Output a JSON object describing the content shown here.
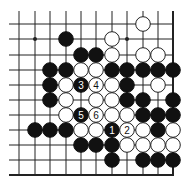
{
  "diagram": {
    "colors": {
      "background": "#ffffff",
      "line": "#222222",
      "black_stone": "#111111",
      "white_stone": "#ffffff",
      "white_stroke": "#222222"
    },
    "grid": {
      "columns_x": [
        19,
        35,
        50,
        66,
        81,
        96,
        112,
        127,
        143,
        158,
        173
      ],
      "rows_y": [
        24,
        39,
        55,
        70,
        85,
        100,
        115,
        130,
        145,
        160,
        175
      ],
      "line_left_x": 9,
      "line_top_y": 11,
      "right_edge_col": 10,
      "bottom_edge_row": 10,
      "stone_radius": 7.3
    },
    "star_points": [
      {
        "col": 1,
        "row": 1
      },
      {
        "col": 7,
        "row": 1
      }
    ],
    "stones": [
      {
        "col": 8,
        "row": 0,
        "color": "white"
      },
      {
        "col": 3,
        "row": 1,
        "color": "black"
      },
      {
        "col": 6,
        "row": 1,
        "color": "white"
      },
      {
        "col": 4,
        "row": 2,
        "color": "black"
      },
      {
        "col": 5,
        "row": 2,
        "color": "black"
      },
      {
        "col": 6,
        "row": 2,
        "color": "white"
      },
      {
        "col": 8,
        "row": 2,
        "color": "white"
      },
      {
        "col": 9,
        "row": 2,
        "color": "white"
      },
      {
        "col": 2,
        "row": 3,
        "color": "black"
      },
      {
        "col": 3,
        "row": 3,
        "color": "black"
      },
      {
        "col": 4,
        "row": 3,
        "color": "white"
      },
      {
        "col": 5,
        "row": 3,
        "color": "white"
      },
      {
        "col": 6,
        "row": 3,
        "color": "black"
      },
      {
        "col": 7,
        "row": 3,
        "color": "black"
      },
      {
        "col": 8,
        "row": 3,
        "color": "black"
      },
      {
        "col": 9,
        "row": 3,
        "color": "black"
      },
      {
        "col": 10,
        "row": 3,
        "color": "black"
      },
      {
        "col": 2,
        "row": 4,
        "color": "black"
      },
      {
        "col": 3,
        "row": 4,
        "color": "white"
      },
      {
        "col": 4,
        "row": 4,
        "color": "black",
        "label": "3"
      },
      {
        "col": 5,
        "row": 4,
        "color": "white",
        "label": "4"
      },
      {
        "col": 6,
        "row": 4,
        "color": "white"
      },
      {
        "col": 7,
        "row": 4,
        "color": "black"
      },
      {
        "col": 9,
        "row": 4,
        "color": "white"
      },
      {
        "col": 2,
        "row": 5,
        "color": "black"
      },
      {
        "col": 3,
        "row": 5,
        "color": "white"
      },
      {
        "col": 5,
        "row": 5,
        "color": "white"
      },
      {
        "col": 6,
        "row": 5,
        "color": "white"
      },
      {
        "col": 7,
        "row": 5,
        "color": "black"
      },
      {
        "col": 8,
        "row": 5,
        "color": "black"
      },
      {
        "col": 10,
        "row": 5,
        "color": "black"
      },
      {
        "col": 3,
        "row": 6,
        "color": "white"
      },
      {
        "col": 4,
        "row": 6,
        "color": "black",
        "label": "5"
      },
      {
        "col": 5,
        "row": 6,
        "color": "white",
        "label": "6"
      },
      {
        "col": 6,
        "row": 6,
        "color": "white"
      },
      {
        "col": 7,
        "row": 6,
        "color": "white"
      },
      {
        "col": 8,
        "row": 6,
        "color": "black"
      },
      {
        "col": 9,
        "row": 6,
        "color": "black"
      },
      {
        "col": 10,
        "row": 6,
        "color": "black"
      },
      {
        "col": 1,
        "row": 7,
        "color": "black"
      },
      {
        "col": 2,
        "row": 7,
        "color": "black"
      },
      {
        "col": 3,
        "row": 7,
        "color": "black"
      },
      {
        "col": 4,
        "row": 7,
        "color": "white"
      },
      {
        "col": 5,
        "row": 7,
        "color": "white"
      },
      {
        "col": 6,
        "row": 7,
        "color": "black",
        "label": "1"
      },
      {
        "col": 7,
        "row": 7,
        "color": "white",
        "label": "2"
      },
      {
        "col": 8,
        "row": 7,
        "color": "white"
      },
      {
        "col": 9,
        "row": 7,
        "color": "black"
      },
      {
        "col": 10,
        "row": 7,
        "color": "white"
      },
      {
        "col": 4,
        "row": 8,
        "color": "black"
      },
      {
        "col": 5,
        "row": 8,
        "color": "black"
      },
      {
        "col": 6,
        "row": 8,
        "color": "black"
      },
      {
        "col": 7,
        "row": 8,
        "color": "white"
      },
      {
        "col": 8,
        "row": 8,
        "color": "white"
      },
      {
        "col": 9,
        "row": 8,
        "color": "white"
      },
      {
        "col": 10,
        "row": 8,
        "color": "white"
      },
      {
        "col": 6,
        "row": 9,
        "color": "black"
      },
      {
        "col": 8,
        "row": 9,
        "color": "black"
      },
      {
        "col": 9,
        "row": 9,
        "color": "black"
      },
      {
        "col": 10,
        "row": 9,
        "color": "black"
      }
    ]
  }
}
